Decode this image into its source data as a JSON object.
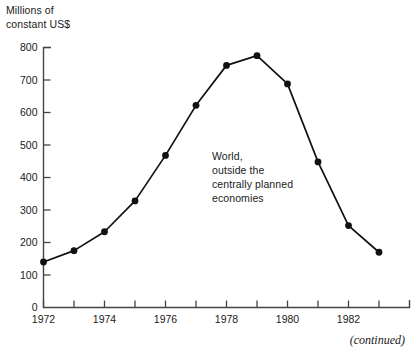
{
  "figure": {
    "y_axis_caption": "Millions of\nconstant US$",
    "annotation": "World,\noutside the\ncentrally planned\neconomies",
    "continued_note": "(continued)",
    "line_color": "#111111",
    "marker_color": "#111111",
    "axis_color": "#444444",
    "background": "#ffffff"
  },
  "chart_data": {
    "type": "line",
    "title": "",
    "subtitle": "",
    "xlabel": "",
    "ylabel": "Millions of constant US$",
    "x": [
      1972,
      1973,
      1974,
      1975,
      1976,
      1977,
      1978,
      1979,
      1980,
      1981,
      1982,
      1983
    ],
    "values": [
      140,
      175,
      233,
      328,
      468,
      622,
      745,
      775,
      688,
      448,
      252,
      170
    ],
    "series": [
      {
        "name": "World, outside the centrally planned economies",
        "values": [
          140,
          175,
          233,
          328,
          468,
          622,
          745,
          775,
          688,
          448,
          252,
          170
        ]
      }
    ],
    "xlim": [
      1972,
      1983
    ],
    "ylim": [
      0,
      800
    ],
    "ytick_labels": [
      "0",
      "100",
      "200",
      "300",
      "400",
      "500",
      "600",
      "700",
      "800"
    ],
    "ytick_values": [
      0,
      100,
      200,
      300,
      400,
      500,
      600,
      700,
      800
    ],
    "xtick_values": [
      1972,
      1973,
      1974,
      1975,
      1976,
      1977,
      1978,
      1979,
      1980,
      1981,
      1982,
      1983
    ],
    "xtick_labels": [
      "1972",
      "",
      "1974",
      "",
      "1976",
      "",
      "1978",
      "",
      "1980",
      "",
      "1982",
      ""
    ],
    "grid": false,
    "legend": "none",
    "marker": "filled-circle",
    "annotations": [
      {
        "text": "World, outside the centrally planned economies",
        "x": 1978,
        "y": 420
      }
    ]
  }
}
